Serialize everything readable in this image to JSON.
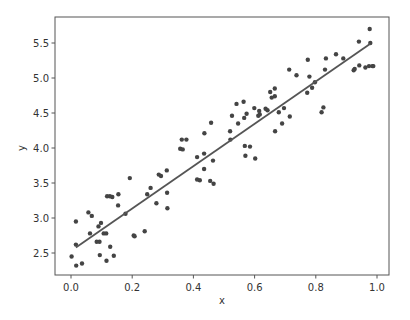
{
  "chart_data": {
    "type": "scatter",
    "title": "",
    "xlabel": "x",
    "ylabel": "y",
    "xlim": [
      -0.05,
      1.04
    ],
    "ylim": [
      2.15,
      5.83
    ],
    "grid": false,
    "legend": null,
    "x_ticks": [
      0.0,
      0.2,
      0.4,
      0.6,
      0.8,
      1.0
    ],
    "x_tick_labels": [
      "0.0",
      "0.2",
      "0.4",
      "0.6",
      "0.8",
      "1.0"
    ],
    "y_ticks": [
      2.5,
      3.0,
      3.5,
      4.0,
      4.5,
      5.0,
      5.5
    ],
    "y_tick_labels": [
      "2.5",
      "3.0",
      "3.5",
      "4.0",
      "4.5",
      "5.0",
      "5.5"
    ],
    "series": [
      {
        "name": "data points",
        "kind": "scatter",
        "color": "#444444",
        "points": [
          [
            0.002,
            2.45
          ],
          [
            0.016,
            2.62
          ],
          [
            0.017,
            2.32
          ],
          [
            0.016,
            2.95
          ],
          [
            0.036,
            2.35
          ],
          [
            0.057,
            3.08
          ],
          [
            0.068,
            3.03
          ],
          [
            0.062,
            2.78
          ],
          [
            0.084,
            2.66
          ],
          [
            0.093,
            2.66
          ],
          [
            0.09,
            2.88
          ],
          [
            0.098,
            2.93
          ],
          [
            0.094,
            2.47
          ],
          [
            0.107,
            2.78
          ],
          [
            0.115,
            2.78
          ],
          [
            0.116,
            2.39
          ],
          [
            0.118,
            3.31
          ],
          [
            0.127,
            3.31
          ],
          [
            0.135,
            3.3
          ],
          [
            0.128,
            2.59
          ],
          [
            0.14,
            2.46
          ],
          [
            0.155,
            3.34
          ],
          [
            0.154,
            3.18
          ],
          [
            0.178,
            3.06
          ],
          [
            0.192,
            3.57
          ],
          [
            0.205,
            2.75
          ],
          [
            0.208,
            2.74
          ],
          [
            0.241,
            2.81
          ],
          [
            0.249,
            3.34
          ],
          [
            0.26,
            3.43
          ],
          [
            0.279,
            3.21
          ],
          [
            0.287,
            3.62
          ],
          [
            0.294,
            3.6
          ],
          [
            0.313,
            3.68
          ],
          [
            0.314,
            3.36
          ],
          [
            0.315,
            3.14
          ],
          [
            0.357,
            3.99
          ],
          [
            0.365,
            3.98
          ],
          [
            0.362,
            4.12
          ],
          [
            0.377,
            4.12
          ],
          [
            0.412,
            3.87
          ],
          [
            0.412,
            3.55
          ],
          [
            0.421,
            3.54
          ],
          [
            0.435,
            3.7
          ],
          [
            0.436,
            4.21
          ],
          [
            0.435,
            3.92
          ],
          [
            0.455,
            3.53
          ],
          [
            0.458,
            4.36
          ],
          [
            0.464,
            3.82
          ],
          [
            0.466,
            3.49
          ],
          [
            0.52,
            4.24
          ],
          [
            0.521,
            4.12
          ],
          [
            0.526,
            4.46
          ],
          [
            0.541,
            4.63
          ],
          [
            0.546,
            4.35
          ],
          [
            0.564,
            4.66
          ],
          [
            0.566,
            4.43
          ],
          [
            0.568,
            4.03
          ],
          [
            0.57,
            3.89
          ],
          [
            0.574,
            4.49
          ],
          [
            0.585,
            4.02
          ],
          [
            0.599,
            4.57
          ],
          [
            0.602,
            3.85
          ],
          [
            0.612,
            4.46
          ],
          [
            0.615,
            4.53
          ],
          [
            0.617,
            4.48
          ],
          [
            0.636,
            4.56
          ],
          [
            0.642,
            4.54
          ],
          [
            0.651,
            4.8
          ],
          [
            0.656,
            4.72
          ],
          [
            0.666,
            4.85
          ],
          [
            0.666,
            4.74
          ],
          [
            0.667,
            4.24
          ],
          [
            0.679,
            4.51
          ],
          [
            0.69,
            4.35
          ],
          [
            0.696,
            4.57
          ],
          [
            0.713,
            5.12
          ],
          [
            0.715,
            4.45
          ],
          [
            0.737,
            5.04
          ],
          [
            0.772,
            4.79
          ],
          [
            0.774,
            5.26
          ],
          [
            0.779,
            5.02
          ],
          [
            0.788,
            4.86
          ],
          [
            0.797,
            4.94
          ],
          [
            0.819,
            4.51
          ],
          [
            0.825,
            4.58
          ],
          [
            0.83,
            5.12
          ],
          [
            0.833,
            5.28
          ],
          [
            0.866,
            5.34
          ],
          [
            0.89,
            5.28
          ],
          [
            0.924,
            5.11
          ],
          [
            0.927,
            5.13
          ],
          [
            0.941,
            5.52
          ],
          [
            0.942,
            5.18
          ],
          [
            0.962,
            5.15
          ],
          [
            0.974,
            5.17
          ],
          [
            0.976,
            5.7
          ],
          [
            0.978,
            5.5
          ],
          [
            0.985,
            5.17
          ],
          [
            0.988,
            5.17
          ]
        ]
      },
      {
        "name": "fitted line",
        "kind": "line",
        "color": "#555555",
        "x": [
          0.016,
          0.978
        ],
        "y": [
          2.58,
          5.49
        ]
      }
    ]
  }
}
